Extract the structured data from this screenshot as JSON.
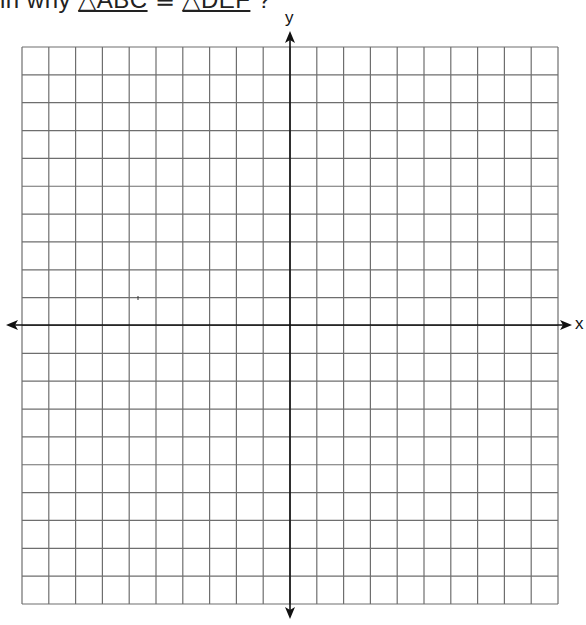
{
  "question": {
    "prefix": "in why ",
    "tri1": "△ABC",
    "relation": " ≅ ",
    "tri2": "△DEF",
    "suffix": " ?"
  },
  "grid": {
    "columns": 20,
    "rows": 20,
    "left": 22,
    "top": 47,
    "right": 558,
    "bottom": 604,
    "line_color": "#6e6e6e",
    "axis_color": "#111111"
  },
  "axes": {
    "x_label": "x",
    "y_label": "y",
    "origin_x": 290,
    "origin_y": 325
  },
  "marks": [
    {
      "type": "tick",
      "x": 138,
      "y": 298
    }
  ]
}
